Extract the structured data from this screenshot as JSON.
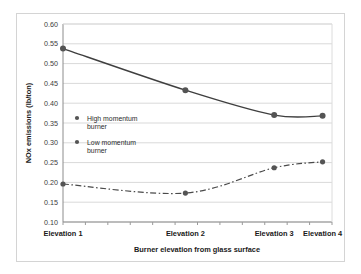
{
  "chart_data": {
    "type": "line",
    "title": "",
    "xlabel": "Burner elevation from glass surface",
    "ylabel": "NOx emissions (lb/ton)",
    "categories": [
      "Elevation 1",
      "Elevation 2",
      "Elevation 3",
      "Elevation 4"
    ],
    "category_positions": [
      0,
      0.455,
      0.785,
      0.965
    ],
    "ylim": [
      0.1,
      0.6
    ],
    "yticks": [
      "0.10",
      "0.15",
      "0.20",
      "0.25",
      "0.30",
      "0.35",
      "0.40",
      "0.45",
      "0.50",
      "0.55",
      "0.60"
    ],
    "ytick_values": [
      0.1,
      0.15,
      0.2,
      0.25,
      0.3,
      0.35,
      0.4,
      0.45,
      0.5,
      0.55,
      0.6
    ],
    "grid": "horizontal",
    "legend_position": "inside-left",
    "series": [
      {
        "name": "High momentum burner",
        "label_line1": "High momentum",
        "label_line2": "burner",
        "values": [
          0.538,
          0.433,
          0.37,
          0.368
        ],
        "line_style": "solid",
        "color": "#3f3f3f"
      },
      {
        "name": "Low momentum burner",
        "label_line1": "Low momentum",
        "label_line2": "burner",
        "values": [
          0.196,
          0.173,
          0.237,
          0.252
        ],
        "line_style": "dash-dot",
        "color": "#4a4a4a"
      }
    ]
  },
  "colors": {
    "axis": "#8c8c8c",
    "grid": "#d9d9d9",
    "marker": "#545454",
    "text": "#1a1a1a",
    "frame": "#d4d4d4"
  }
}
